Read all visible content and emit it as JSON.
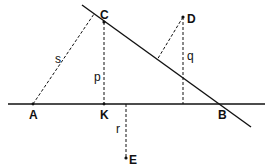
{
  "diagram": {
    "points": {
      "A": {
        "label": "A",
        "x": 33,
        "y": 104
      },
      "K": {
        "label": "K",
        "x": 104,
        "y": 104
      },
      "B": {
        "label": "B",
        "x": 222,
        "y": 104
      },
      "C": {
        "label": "C",
        "x": 104,
        "y": 22
      },
      "D": {
        "label": "D",
        "x": 183,
        "y": 17
      },
      "E": {
        "label": "E",
        "x": 126,
        "y": 158
      }
    },
    "segments": {
      "s": {
        "label": "s"
      },
      "p": {
        "label": "p"
      },
      "q": {
        "label": "q"
      },
      "r": {
        "label": "r"
      }
    },
    "colors": {
      "stroke": "#111111",
      "background": "#ffffff"
    }
  }
}
